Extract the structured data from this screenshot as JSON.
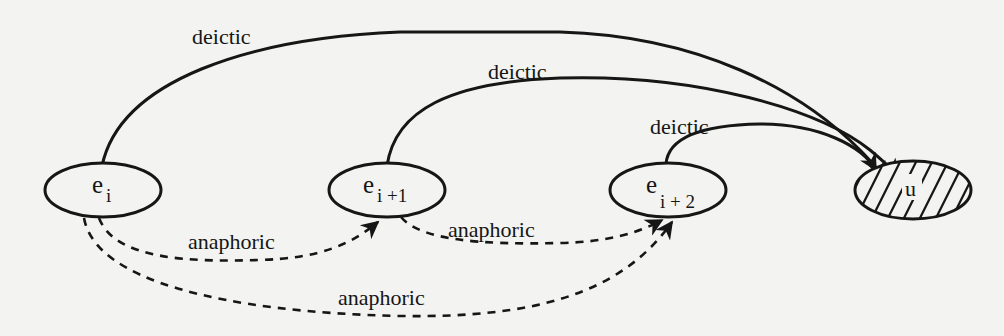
{
  "diagram": {
    "type": "reference-graph",
    "colors": {
      "ink": "#161616",
      "background": "#f3f3f1"
    },
    "nodes": [
      {
        "id": "ei",
        "base": "e",
        "sub": "i",
        "hatched": false
      },
      {
        "id": "ei1",
        "base": "e",
        "sub": "i +1",
        "hatched": false
      },
      {
        "id": "ei2",
        "base": "e",
        "sub": "i + 2",
        "hatched": false
      },
      {
        "id": "u",
        "base": "u",
        "sub": "",
        "hatched": true
      }
    ],
    "edges": [
      {
        "from": "ei",
        "to": "u",
        "label": "deictic",
        "style": "solid"
      },
      {
        "from": "ei1",
        "to": "u",
        "label": "deictic",
        "style": "solid"
      },
      {
        "from": "ei2",
        "to": "u",
        "label": "deictic",
        "style": "solid"
      },
      {
        "from": "ei",
        "to": "ei1",
        "label": "anaphoric",
        "style": "dashed"
      },
      {
        "from": "ei1",
        "to": "ei2",
        "label": "anaphoric",
        "style": "dashed"
      },
      {
        "from": "ei",
        "to": "ei2",
        "label": "anaphoric",
        "style": "dashed"
      }
    ]
  }
}
